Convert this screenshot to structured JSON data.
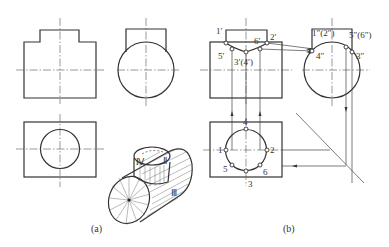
{
  "figure": {
    "panel_a": {
      "caption": "(a)",
      "iso_labels": {
        "iv": "Ⅳ",
        "ii": "Ⅱ",
        "iii": "Ⅲ"
      }
    },
    "panel_b": {
      "caption": "(b)",
      "front_labels": {
        "p1": "1′",
        "p2": "2′",
        "p5": "5′",
        "p6": "6′",
        "p34": "3′(4′)"
      },
      "side_labels": {
        "p12": "1″(2″)",
        "p56": "5″(6″)",
        "p4": "4″",
        "p3": "3″"
      },
      "top_labels": {
        "p1": "1",
        "p2": "2",
        "p3": "3",
        "p4": "4",
        "p5": "5",
        "p6": "6"
      }
    }
  },
  "colors": {
    "line": "#333333",
    "background": "#ffffff"
  }
}
